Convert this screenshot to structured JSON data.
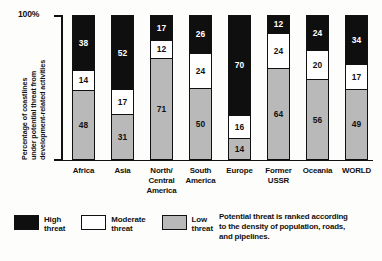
{
  "chart_data": {
    "type": "bar",
    "subtype": "stacked-100-percent",
    "title": "",
    "xlabel": "",
    "ylabel": "Percentage of coastlines under potential threat from development-related activities",
    "ylabel_lines": [
      "Percentage of coastlines",
      "under potential threat from",
      "development-related activities"
    ],
    "ylim": [
      0,
      100
    ],
    "ytick_labels": [
      "100%"
    ],
    "grid": false,
    "legend_position": "bottom-left",
    "categories": [
      "Africa",
      "Asia",
      "North/ Central America",
      "South America",
      "Europe",
      "Former USSR",
      "Oceania",
      "WORLD"
    ],
    "category_lines": [
      [
        "Africa"
      ],
      [
        "Asia"
      ],
      [
        "North/",
        "Central",
        "America"
      ],
      [
        "South",
        "America"
      ],
      [
        "Europe"
      ],
      [
        "Former",
        "USSR"
      ],
      [
        "Oceania"
      ],
      [
        "WORLD"
      ]
    ],
    "series": [
      {
        "name": "High threat",
        "color": "#100f0f",
        "values": [
          38,
          52,
          17,
          26,
          70,
          12,
          24,
          34
        ]
      },
      {
        "name": "Moderate threat",
        "color": "#ffffff",
        "values": [
          14,
          17,
          12,
          24,
          16,
          24,
          20,
          17
        ]
      },
      {
        "name": "Low threat",
        "color": "#b9b9b9",
        "values": [
          48,
          31,
          71,
          50,
          14,
          64,
          56,
          49
        ]
      }
    ],
    "annotations": [
      "Potential threat is ranked according to the density of population, roads, and pipelines."
    ]
  },
  "legend": {
    "items": [
      {
        "label_line1": "High",
        "label_line2": "threat",
        "swatch": "high"
      },
      {
        "label_line1": "Moderate",
        "label_line2": "threat",
        "swatch": "moderate"
      },
      {
        "label_line1": "Low",
        "label_line2": "threat",
        "swatch": "low"
      }
    ]
  },
  "caption": {
    "lines": [
      "Potential threat is ranked according",
      "to the density of population, roads,",
      "and pipelines."
    ]
  }
}
